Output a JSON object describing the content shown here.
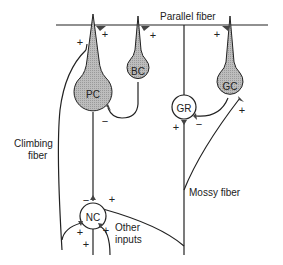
{
  "colors": {
    "cell_fill_excitatory_shaded": "#b8b8b8",
    "line": "#222222",
    "background": "#ffffff"
  },
  "labels": {
    "parallel_fiber": "Parallel fiber",
    "climbing_fiber_1": "Climbing",
    "climbing_fiber_2": "fiber",
    "mossy_fiber": "Mossy fiber",
    "other_inputs_1": "Other",
    "other_inputs_2": "inputs"
  },
  "cells": {
    "pc": "PC",
    "bc": "BC",
    "gr": "GR",
    "gc": "GC",
    "nc": "NC"
  },
  "signs": {
    "plus": "+",
    "minus": "−"
  }
}
